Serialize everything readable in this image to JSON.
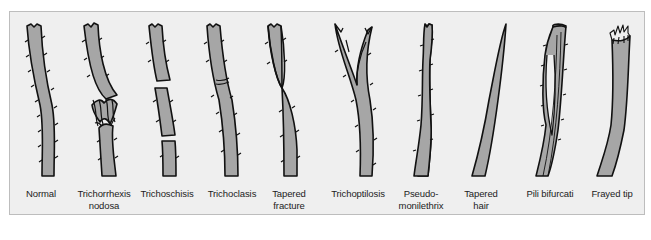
{
  "figure": {
    "colors": {
      "background": "#efefef",
      "border": "#bdbdbd",
      "hair_fill": "#a6a6a6",
      "outline": "#111111",
      "text": "#222222"
    },
    "items": [
      {
        "id": "normal",
        "line1": "Normal",
        "line2": "",
        "x": 41
      },
      {
        "id": "trichorrhexis-nodosa",
        "line1": "Trichorrhexis",
        "line2": "nodosa",
        "x": 104
      },
      {
        "id": "trichoschisis",
        "line1": "Trichoschisis",
        "line2": "",
        "x": 167
      },
      {
        "id": "trichoclasis",
        "line1": "Trichoclasis",
        "line2": "",
        "x": 232
      },
      {
        "id": "tapered-fracture",
        "line1": "Tapered",
        "line2": "fracture",
        "x": 289
      },
      {
        "id": "trichoptilosis",
        "line1": "Trichoptilosis",
        "line2": "",
        "x": 358
      },
      {
        "id": "pseudo-monilethrix",
        "line1": "Pseudo-",
        "line2": "monilethrix",
        "x": 421
      },
      {
        "id": "tapered-hair",
        "line1": "Tapered",
        "line2": "hair",
        "x": 481
      },
      {
        "id": "pili-bifurcati",
        "line1": "Pili bifurcati",
        "line2": "",
        "x": 550
      },
      {
        "id": "frayed-tip",
        "line1": "Frayed tip",
        "line2": "",
        "x": 612
      }
    ]
  }
}
